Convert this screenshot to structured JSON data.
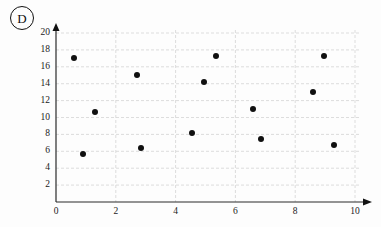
{
  "panel": {
    "letter": "D"
  },
  "chart_data": {
    "type": "scatter",
    "title": "",
    "subtitle": "",
    "xlabel": "",
    "ylabel": "",
    "xlim": [
      0,
      10
    ],
    "ylim": [
      0,
      20
    ],
    "xticks": [
      0,
      2,
      4,
      6,
      8,
      10
    ],
    "yticks": [
      2,
      4,
      6,
      8,
      10,
      12,
      14,
      16,
      18,
      20
    ],
    "xtick_labels": [
      "0",
      "2",
      "4",
      "6",
      "8",
      "10"
    ],
    "ytick_labels": [
      "2",
      "4",
      "6",
      "8",
      "10",
      "12",
      "14",
      "16",
      "18",
      "20"
    ],
    "grid": true,
    "grid_style": "dashed",
    "grid_color": "#cfcfcf",
    "legend": null,
    "marker_color": "#101010",
    "marker_size": 6,
    "axis_arrows": true,
    "points": [
      {
        "x": 0.6,
        "y": 17.0
      },
      {
        "x": 0.9,
        "y": 5.7
      },
      {
        "x": 1.3,
        "y": 10.7
      },
      {
        "x": 2.7,
        "y": 15.0
      },
      {
        "x": 2.85,
        "y": 6.4
      },
      {
        "x": 4.55,
        "y": 8.2
      },
      {
        "x": 4.95,
        "y": 14.2
      },
      {
        "x": 5.35,
        "y": 17.3
      },
      {
        "x": 6.6,
        "y": 11.0
      },
      {
        "x": 6.85,
        "y": 7.5
      },
      {
        "x": 8.6,
        "y": 13.0
      },
      {
        "x": 8.95,
        "y": 17.3
      },
      {
        "x": 9.3,
        "y": 6.8
      }
    ]
  }
}
